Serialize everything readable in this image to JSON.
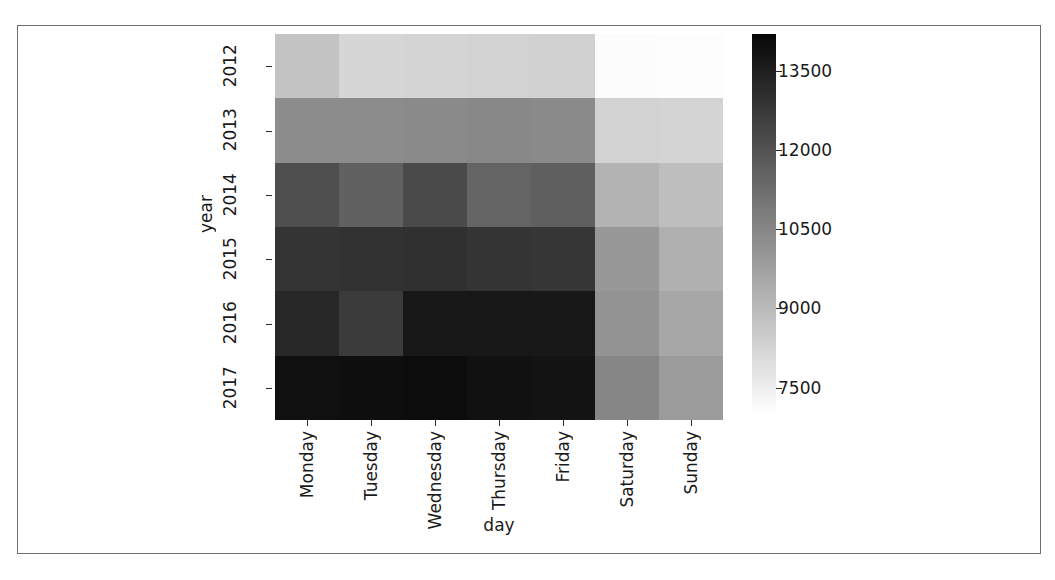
{
  "chart_data": {
    "type": "heatmap",
    "title": "",
    "xlabel": "day",
    "ylabel": "year",
    "x_categories": [
      "Monday",
      "Tuesday",
      "Wednesday",
      "Thursday",
      "Friday",
      "Saturday",
      "Sunday"
    ],
    "y_categories": [
      "2012",
      "2013",
      "2014",
      "2015",
      "2016",
      "2017"
    ],
    "colorbar": {
      "ticks": [
        "13500",
        "12000",
        "10500",
        "9000",
        "7500"
      ],
      "tick_values": [
        13500,
        12000,
        10500,
        9000,
        7500
      ],
      "vmin": 7000,
      "vmax": 14200,
      "colormap": "Greys",
      "orientation": "vertical",
      "position": "right"
    },
    "grid": false,
    "values": [
      [
        8700,
        8200,
        8250,
        8300,
        8350,
        7100,
        7050
      ],
      [
        10300,
        10350,
        10400,
        10450,
        10400,
        8300,
        8250
      ],
      [
        12100,
        11600,
        12250,
        11500,
        11650,
        9200,
        8900
      ],
      [
        12900,
        12950,
        13000,
        12900,
        12850,
        10000,
        9300
      ],
      [
        13250,
        12700,
        13700,
        13750,
        13700,
        10150,
        9550
      ],
      [
        13950,
        14000,
        14050,
        13900,
        13850,
        10500,
        9900
      ]
    ],
    "row_labels": [
      "2012",
      "2013",
      "2014",
      "2015",
      "2016",
      "2017"
    ],
    "column_labels": [
      "Monday",
      "Tuesday",
      "Wednesday",
      "Thursday",
      "Friday",
      "Saturday",
      "Sunday"
    ]
  },
  "axes": {
    "x_axis_title": "day",
    "y_axis_title": "year"
  }
}
